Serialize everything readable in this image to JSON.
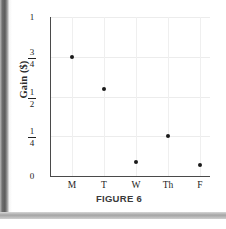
{
  "figure": {
    "caption": "FIGURE 6"
  },
  "chart_data": {
    "type": "scatter",
    "title": "",
    "xlabel": "",
    "ylabel": "Gain ($)",
    "categories": [
      "M",
      "T",
      "W",
      "Th",
      "F"
    ],
    "values": [
      0.75,
      0.55,
      0.09,
      0.25,
      0.07
    ],
    "value_labels": [
      "3/4",
      "",
      "",
      "1/4",
      ""
    ],
    "series": [
      {
        "name": "Gain ($)",
        "points": [
          {
            "x": "M",
            "y": 0.75
          },
          {
            "x": "T",
            "y": 0.55
          },
          {
            "x": "W",
            "y": 0.09
          },
          {
            "x": "Th",
            "y": 0.25
          },
          {
            "x": "F",
            "y": 0.07
          }
        ]
      }
    ],
    "ylim": [
      0,
      1
    ],
    "yticks": [
      0,
      0.25,
      0.5,
      0.75,
      1
    ],
    "ytick_labels": [
      "0",
      "1/4",
      "1/2",
      "3/4",
      "1"
    ],
    "ytick_label_parts": [
      {
        "kind": "whole",
        "text": "0"
      },
      {
        "kind": "fraction",
        "num": "1",
        "den": "4"
      },
      {
        "kind": "fraction",
        "num": "1",
        "den": "2"
      },
      {
        "kind": "fraction",
        "num": "3",
        "den": "4"
      },
      {
        "kind": "whole",
        "text": "1"
      }
    ],
    "xtick_labels": [
      "M",
      "T",
      "W",
      "Th",
      "F"
    ],
    "grid": true,
    "grid_color": "#ececec",
    "legend": "none",
    "marker_color": "#1a1a1a",
    "axis_color": "#4a4a4a"
  }
}
